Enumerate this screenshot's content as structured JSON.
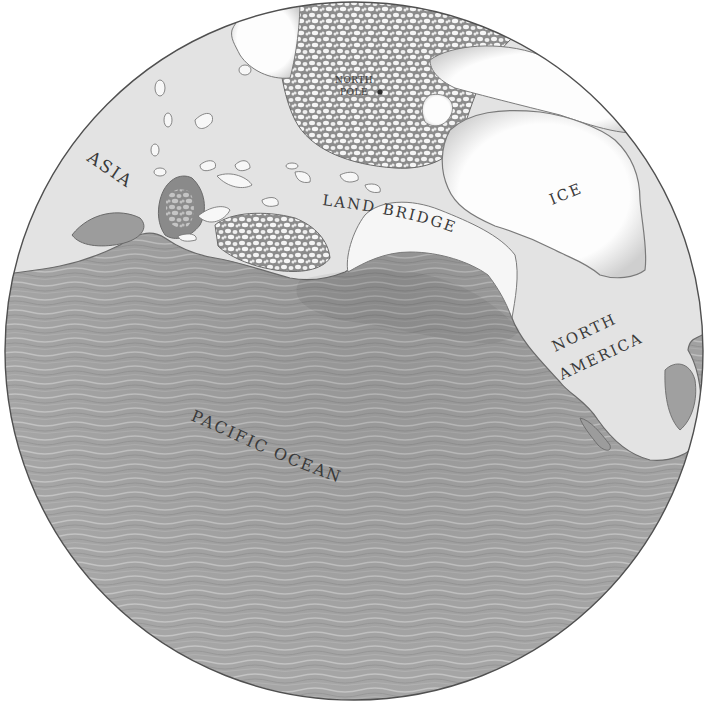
{
  "map": {
    "title": "Bering Land Bridge globe view",
    "colors": {
      "background": "#ffffff",
      "ocean": "#a9a9a9",
      "ocean_dark": "#8f8f8f",
      "ocean_wave": "#c8c8c8",
      "land": "#e4e4e4",
      "ice": "#fbfbfb",
      "ice_shade": "#bdbdbd",
      "pack_ice": "#d6d6d6",
      "outline": "#6a6a6a",
      "label": "#3a3a3a"
    },
    "globe": {
      "cx": 354,
      "cy": 351,
      "r": 349
    },
    "labels": {
      "north_pole_line1": "NORTH",
      "north_pole_line2": "POLE",
      "asia": "ASIA",
      "land_bridge": "LAND BRIDGE",
      "ice": "ICE",
      "north_america_line1": "NORTH",
      "north_america_line2": "AMERICA",
      "pacific_ocean": "PACIFIC OCEAN"
    },
    "markers": [
      {
        "name": "north-pole-marker",
        "x": 380,
        "y": 92
      }
    ]
  }
}
